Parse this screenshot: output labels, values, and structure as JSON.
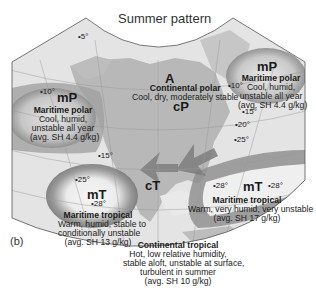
{
  "title": "Summer pattern",
  "panel_label": "(b)",
  "colors": {
    "ocean": "#e6e6e6",
    "land": "#b4b4b4",
    "airmass_shade": "#8c8c8c",
    "grid": "#9a9a9a"
  },
  "air_masses": [
    {
      "id": "A",
      "code": "A",
      "name": "",
      "description": []
    },
    {
      "id": "cP",
      "code": "cP",
      "name": "Continental polar",
      "description": [
        "Cool, dry, moderately stable"
      ]
    },
    {
      "id": "mP-pacific",
      "code": "mP",
      "name": "Maritime polar",
      "description": [
        "Cool, humid,",
        "unstable all year",
        "(avg. SH 4.4 g/kg)"
      ]
    },
    {
      "id": "mP-atlantic",
      "code": "mP",
      "name": "Maritime polar",
      "description": [
        "Cool, humid,",
        "unstable all year",
        "(avg. SH 4.4 g/kg)"
      ]
    },
    {
      "id": "mT-pacific",
      "code": "mT",
      "name": "Maritime tropical",
      "description": [
        "Warm, humid, stable to",
        "conditionally unstable",
        "(avg. SH 13 g/kg)"
      ]
    },
    {
      "id": "mT-atlantic",
      "code": "mT",
      "name": "Maritime tropical",
      "description": [
        "Warm, very humid, very unstable",
        "(avg. SH 17 g/kg)"
      ]
    },
    {
      "id": "cT",
      "code": "cT",
      "name": "Continental tropical",
      "description": [
        "Hot, low relative humidity,",
        "stable aloft, unstable at surface,",
        "turbulent in summer",
        "(avg. SH 10 g/kg)"
      ]
    }
  ],
  "temperatures": [
    {
      "label": "5°"
    },
    {
      "label": "10°"
    },
    {
      "label": "10°"
    },
    {
      "label": "15°"
    },
    {
      "label": "15°"
    },
    {
      "label": "20°"
    },
    {
      "label": "25°"
    },
    {
      "label": "25°"
    },
    {
      "label": "28°"
    },
    {
      "label": "28°"
    },
    {
      "label": "28°"
    }
  ]
}
